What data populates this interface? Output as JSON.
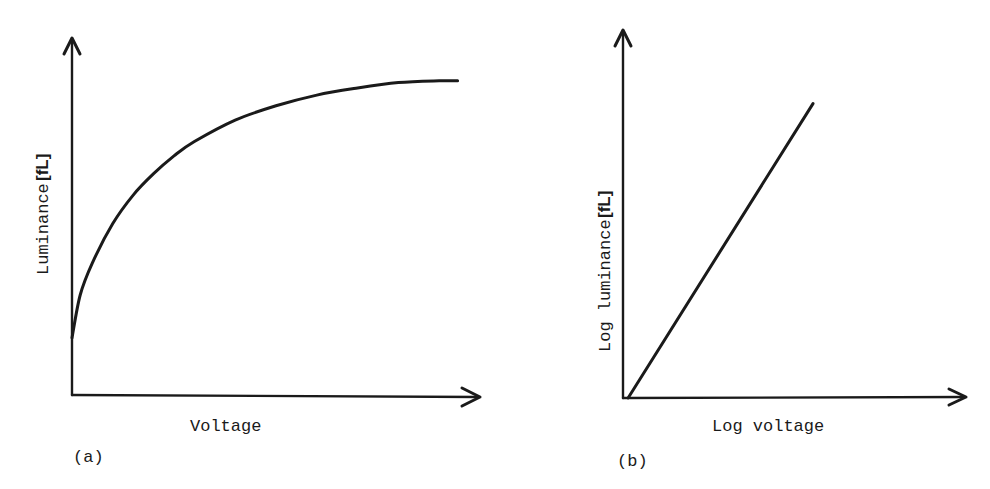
{
  "chart_data": [
    {
      "panel_label": "(a)",
      "type": "line",
      "title": "",
      "xlabel": "Voltage",
      "ylabel": "Luminance",
      "ylabel_unit": "[fL]",
      "grid": false,
      "ticks": "none",
      "xlim": [
        0,
        1
      ],
      "ylim": [
        0,
        1
      ],
      "series": [
        {
          "name": "luminance-vs-voltage",
          "x": [
            0.0,
            0.02,
            0.05,
            0.1,
            0.15,
            0.2,
            0.25,
            0.3,
            0.4,
            0.5,
            0.6,
            0.7,
            0.8,
            0.9,
            0.945
          ],
          "y": [
            0.16,
            0.28,
            0.37,
            0.48,
            0.56,
            0.62,
            0.67,
            0.71,
            0.77,
            0.81,
            0.84,
            0.86,
            0.875,
            0.88,
            0.88
          ]
        }
      ]
    },
    {
      "panel_label": "(b)",
      "type": "line",
      "title": "",
      "xlabel": "Log voltage",
      "ylabel": "Log luminance",
      "ylabel_unit": "[fL]",
      "grid": false,
      "ticks": "none",
      "xlim": [
        0,
        1
      ],
      "ylim": [
        0,
        1
      ],
      "series": [
        {
          "name": "log-luminance-vs-log-voltage",
          "x": [
            0.015,
            0.554
          ],
          "y": [
            0.0,
            0.8
          ]
        }
      ]
    }
  ]
}
